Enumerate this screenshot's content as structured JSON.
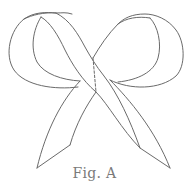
{
  "figure": {
    "caption": "Fig. A",
    "stroke_color": "#6a6a6a",
    "caption_color": "#7a7a7a",
    "background": "#ffffff"
  }
}
